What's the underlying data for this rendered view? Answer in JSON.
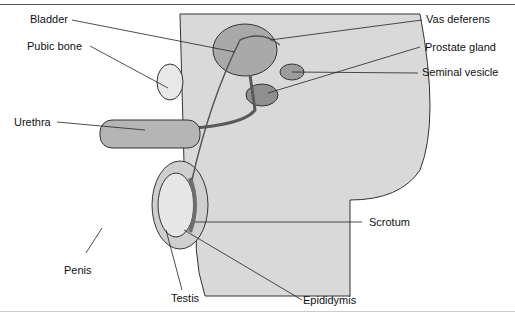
{
  "diagram": {
    "labels": {
      "bladder": "Bladder",
      "pubic_bone": "Pubic bone",
      "urethra": "Urethra",
      "penis": "Penis",
      "testis": "Testis",
      "epididymis": "Epididymis",
      "scrotum": "Scrotum",
      "seminal_vesicle": "Seminal vesicle",
      "prostate_gland": "Prostate gland",
      "vas_deferens": "Vas deferens"
    },
    "colors": {
      "tissue_light": "#d9d9d9",
      "tissue_mid": "#a9a9a9",
      "tissue_dark": "#5a5a5a",
      "outline": "#333333",
      "leader_line": "#222222"
    }
  }
}
